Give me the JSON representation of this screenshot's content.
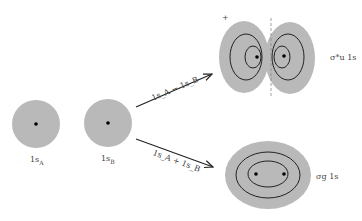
{
  "atomic_orbitals": [
    {
      "id": "A",
      "label": "1s",
      "sub": "A"
    },
    {
      "id": "B",
      "label": "1s",
      "sub": "B"
    }
  ],
  "combinations": {
    "antibonding": {
      "arrow_label": "1s_A − 1s_B",
      "orbital_label": "σ*u 1s",
      "sign": "+"
    },
    "bonding": {
      "arrow_label": "1s_A + 1s_B",
      "orbital_label": "σg 1s"
    }
  },
  "colors": {
    "cloud_fill": "#b9b9b9",
    "contour": "#222222",
    "nucleus": "#000000",
    "arrow": "#222222",
    "node_line": "#888888"
  }
}
